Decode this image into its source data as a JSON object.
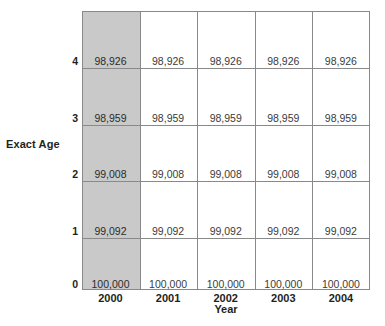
{
  "axes": {
    "y_title": "Exact Age",
    "x_title": "Year"
  },
  "colors": {
    "grid_line": "#898989",
    "highlight_column": "#c9c9c9",
    "text": "#231f20",
    "value_text": "#3b3b3b",
    "background": "#ffffff"
  },
  "chart_data": {
    "type": "heatmap",
    "title": "",
    "xlabel": "Year",
    "ylabel": "Exact Age",
    "categories": [
      "2000",
      "2001",
      "2002",
      "2003",
      "2004"
    ],
    "x": [
      "2000",
      "2001",
      "2002",
      "2003",
      "2004"
    ],
    "y_ticks": [
      "4",
      "3",
      "2",
      "1",
      "0"
    ],
    "grid": true,
    "legend": "none",
    "highlighted_column": "2000",
    "rows": [
      {
        "age": "4",
        "values": [
          "98,926",
          "98,926",
          "98,926",
          "98,926",
          "98,926"
        ]
      },
      {
        "age": "3",
        "values": [
          "98,959",
          "98,959",
          "98,959",
          "98,959",
          "98,959"
        ]
      },
      {
        "age": "2",
        "values": [
          "99,008",
          "99,008",
          "99,008",
          "99,008",
          "99,008"
        ]
      },
      {
        "age": "1",
        "values": [
          "99,092",
          "99,092",
          "99,092",
          "99,092",
          "99,092"
        ]
      },
      {
        "age": "0",
        "values": [
          "100,000",
          "100,000",
          "100,000",
          "100,000",
          "100,000"
        ]
      }
    ],
    "series": [
      {
        "name": "2000",
        "values": [
          98926,
          98959,
          99008,
          99092,
          100000
        ]
      },
      {
        "name": "2001",
        "values": [
          98926,
          98959,
          99008,
          99092,
          100000
        ]
      },
      {
        "name": "2002",
        "values": [
          98926,
          98959,
          99008,
          99092,
          100000
        ]
      },
      {
        "name": "2003",
        "values": [
          98926,
          98959,
          99008,
          99092,
          100000
        ]
      },
      {
        "name": "2004",
        "values": [
          98926,
          98959,
          99008,
          99092,
          100000
        ]
      }
    ]
  }
}
